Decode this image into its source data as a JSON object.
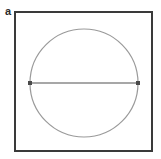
{
  "figure": {
    "panel_label": "a",
    "background_color": "#ffffff",
    "width": 161,
    "height": 159
  },
  "chart_data": {
    "type": "diagram",
    "title": "",
    "subtitle": "",
    "xlabel": "",
    "ylabel": "",
    "grid": false,
    "legend": null,
    "annotations": [
      {
        "name": "panel-label",
        "text": "a",
        "x": 6,
        "y": 12
      }
    ],
    "shapes": [
      {
        "name": "bounding-square",
        "type": "rect",
        "x": 15,
        "y": 12,
        "width": 137,
        "height": 139,
        "fill": "none",
        "stroke": "#3a3a3a",
        "stroke_width": 2
      },
      {
        "name": "inscribed-circle",
        "type": "circle",
        "cx": 84,
        "cy": 83,
        "r": 54,
        "fill": "none",
        "stroke": "#9a9a9a",
        "stroke_width": 1.2
      },
      {
        "name": "horizontal-diameter",
        "type": "line",
        "x1": 30,
        "y1": 83,
        "x2": 138,
        "y2": 83,
        "stroke": "#8a8a8a",
        "stroke_width": 1.6
      },
      {
        "name": "endpoint-marker-left",
        "type": "square-marker",
        "cx": 30,
        "cy": 83,
        "size": 4,
        "fill": "#4a4a4a"
      },
      {
        "name": "endpoint-marker-right",
        "type": "square-marker",
        "cx": 138,
        "cy": 83,
        "size": 4,
        "fill": "#4a4a4a"
      }
    ],
    "colors": {
      "square_stroke": "#3a3a3a",
      "circle_stroke": "#9a9a9a",
      "line_stroke": "#8a8a8a",
      "marker_fill": "#4a4a4a",
      "label_color": "#2b2b2b",
      "background": "#ffffff"
    }
  }
}
